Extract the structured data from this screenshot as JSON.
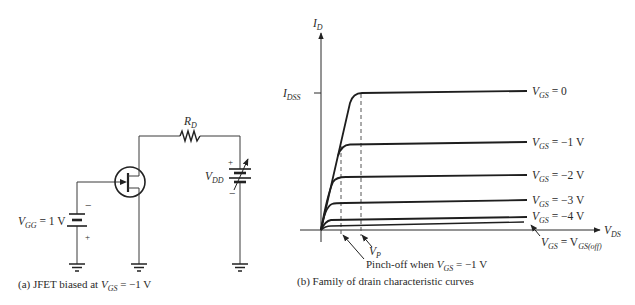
{
  "figure_a": {
    "caption": {
      "prefix": "(a) JFET biased at ",
      "v": "V",
      "sub": "GS",
      "rest": " = −1 V"
    },
    "vgg_label": {
      "v": "V",
      "sub": "GG",
      "rest": " = 1 V"
    },
    "rd_label": {
      "v": "R",
      "sub": "D"
    },
    "vdd_label": {
      "v": "V",
      "sub": "DD"
    },
    "vgg_polarity": {
      "top": "−",
      "bottom": "+"
    },
    "vdd_polarity": {
      "top": "+",
      "bottom": "−"
    }
  },
  "figure_b": {
    "caption": "(b) Family of drain characteristic curves",
    "y_axis": {
      "v": "I",
      "sub": "D"
    },
    "x_axis": {
      "v": "V",
      "sub": "DS"
    },
    "idss": {
      "v": "I",
      "sub": "DSS"
    },
    "vp": {
      "v": "V",
      "sub": "P"
    },
    "pinchoff": {
      "prefix": "Pinch-off when ",
      "v": "V",
      "sub": "GS",
      "rest": " = −1 V"
    },
    "curves": [
      {
        "v": "V",
        "sub": "GS",
        "rest": " = 0"
      },
      {
        "v": "V",
        "sub": "GS",
        "rest": " = −1 V"
      },
      {
        "v": "V",
        "sub": "GS",
        "rest": " = −2 V"
      },
      {
        "v": "V",
        "sub": "GS",
        "rest": " = −3 V"
      },
      {
        "v": "V",
        "sub": "GS",
        "rest": " = −4 V"
      }
    ],
    "off_label": {
      "v": "V",
      "sub": "GS",
      "mid": " = V",
      "sub2": "GS(off)"
    }
  },
  "colors": {
    "line": "#222222",
    "background": "#ffffff"
  }
}
